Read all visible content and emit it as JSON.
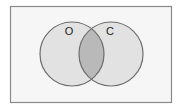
{
  "diagram": {
    "type": "venn",
    "universe": {
      "x": 10,
      "y": 6,
      "width": 161,
      "height": 96,
      "fill": "#f6f6f6",
      "stroke": "#8a8a8a"
    },
    "sets": [
      {
        "label": "O",
        "cx": 72,
        "cy": 54,
        "r": 32,
        "label_x": 69,
        "label_y": 35
      },
      {
        "label": "C",
        "cx": 111,
        "cy": 54,
        "r": 32,
        "label_x": 110,
        "label_y": 35
      }
    ],
    "colors": {
      "set_fill": "#e2e2e2",
      "set_stroke": "#6e6e6e",
      "intersection_fill": "#b9b9b9"
    },
    "shaded_region": "intersection"
  }
}
